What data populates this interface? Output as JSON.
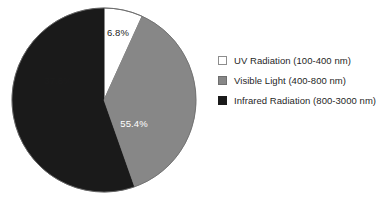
{
  "chart_data": {
    "type": "pie",
    "title": "",
    "subtitle": "",
    "xlabel": "",
    "ylabel": "",
    "grid": false,
    "legend_position": "right",
    "start_angle_deg": 0,
    "direction": "clockwise",
    "categories": [
      "UV Radiation (100-400 nm)",
      "Visible Light (400-800 nm)",
      "Infrared Radiation (800-3000 nm)"
    ],
    "values": [
      6.8,
      37.8,
      55.4
    ],
    "value_unit": "%",
    "data_labels": [
      "6.8%",
      "37.8%",
      "55.4%"
    ],
    "colors": [
      "#ffffff",
      "#878787",
      "#1a1a1a"
    ],
    "slices": [
      {
        "name": "UV Radiation (100-400 nm)",
        "short_name": "UV Radiation",
        "range": "100-400 nm",
        "value": 6.8,
        "label": "6.8%",
        "color": "#ffffff",
        "swatch_style": "sw-white",
        "label_color": "#1c1c1c"
      },
      {
        "name": "Visible Light (400-800 nm)",
        "short_name": "Visible Light",
        "range": "400-800 nm",
        "value": 37.8,
        "label": "37.8%",
        "color": "#878787",
        "swatch_style": "sw-gray",
        "label_color": "#1c1c1c"
      },
      {
        "name": "Infrared Radiation (800-3000 nm)",
        "short_name": "Infrared Radiation",
        "range": "800-3000 nm",
        "value": 55.4,
        "label": "55.4%",
        "color": "#1a1a1a",
        "swatch_style": "sw-black",
        "label_color": "#ffffff"
      }
    ],
    "draw_order": [
      {
        "index": 0,
        "label_index": 0
      },
      {
        "index": 2,
        "label_index": 2
      },
      {
        "index": 1,
        "label_index": 1
      }
    ]
  },
  "pie_geometry": {
    "cx": 104,
    "cy": 100,
    "r": 92,
    "outline_color": "#6a6a6a"
  },
  "label_positions": [
    {
      "x": 118,
      "y": 36
    },
    {
      "x": 58,
      "y": 84
    },
    {
      "x": 134,
      "y": 127
    }
  ],
  "legend": {
    "entries": [
      {
        "label": "UV Radiation (100-400 nm)"
      },
      {
        "label": "Visible Light (400-800 nm)"
      },
      {
        "label": "Infrared Radiation (800-3000 nm)"
      }
    ]
  }
}
